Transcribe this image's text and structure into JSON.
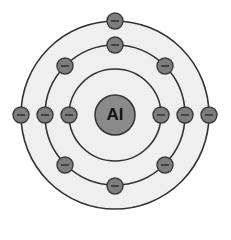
{
  "diagram": {
    "type": "bohr-model",
    "element_symbol": "Al",
    "nucleus": {
      "label": "Al",
      "cx": 115,
      "cy": 115,
      "r": 20,
      "fill": "#8a8a8a"
    },
    "colors": {
      "background_inside": "#efefef",
      "background_outside": "#ffffff",
      "ring_stroke": "#333333",
      "electron_fill": "#7d7d7d",
      "electron_stroke": "#3a3a3a",
      "electron_sign": "#2a2a2a"
    },
    "shells": [
      {
        "name": "shell-1",
        "r": 46,
        "electron_count": 2,
        "electrons": [
          {
            "x": 69,
            "y": 115
          },
          {
            "x": 161,
            "y": 115
          }
        ]
      },
      {
        "name": "shell-2",
        "r": 70,
        "electron_count": 8,
        "electrons": [
          {
            "x": 115,
            "y": 45
          },
          {
            "x": 165,
            "y": 66
          },
          {
            "x": 185,
            "y": 115
          },
          {
            "x": 165,
            "y": 165
          },
          {
            "x": 115,
            "y": 186
          },
          {
            "x": 65,
            "y": 165
          },
          {
            "x": 45,
            "y": 115
          },
          {
            "x": 65,
            "y": 66
          }
        ]
      },
      {
        "name": "shell-3",
        "r": 94,
        "electron_count": 3,
        "electrons": [
          {
            "x": 115,
            "y": 21
          },
          {
            "x": 21,
            "y": 115
          },
          {
            "x": 209,
            "y": 115
          }
        ]
      }
    ],
    "electron_sign": "−"
  }
}
